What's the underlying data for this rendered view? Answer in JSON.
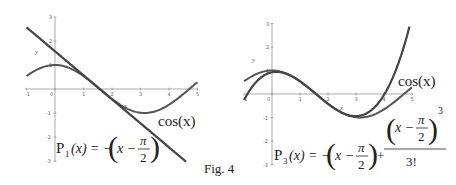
{
  "figure": {
    "caption": "Fig. 4"
  },
  "chart_data": [
    {
      "type": "line",
      "title": "",
      "xlabel": "x",
      "ylabel": "y",
      "xlim": [
        -1,
        5
      ],
      "ylim": [
        -3,
        3
      ],
      "grid": false,
      "x_ticks": [
        "-1",
        "0",
        "1",
        "2",
        "3",
        "4",
        "5"
      ],
      "y_ticks": [
        "3",
        "2",
        "1",
        "-1",
        "-2",
        "-3"
      ],
      "series": [
        {
          "name": "cos(x)",
          "function": "cos(x)",
          "x_range": [
            -1,
            5
          ]
        },
        {
          "name": "P1(x)",
          "function": "-(x - pi/2)",
          "x_range": [
            -1,
            4.6
          ]
        }
      ],
      "annotations": {
        "curve_label": "cos(x)",
        "formula_lhs": "P",
        "formula_sub": "1",
        "formula_arg": "(x) = −",
        "formula_inner": "x −",
        "formula_pi": "π",
        "formula_two": "2"
      }
    },
    {
      "type": "line",
      "title": "",
      "xlabel": "x",
      "ylabel": "y",
      "xlim": [
        -1,
        5
      ],
      "ylim": [
        -3,
        3
      ],
      "grid": false,
      "x_ticks": [
        "-1",
        "0",
        "1",
        "2",
        "3",
        "4",
        "5"
      ],
      "y_ticks": [
        "3",
        "2",
        "1",
        "-1",
        "-2",
        "-3"
      ],
      "series": [
        {
          "name": "cos(x)",
          "function": "cos(x)",
          "x_range": [
            -1,
            5
          ]
        },
        {
          "name": "P3(x)",
          "function": "-(x - pi/2) + (x - pi/2)^3 / 3!",
          "x_range": [
            -1,
            5
          ]
        }
      ],
      "annotations": {
        "curve_label": "cos(x)",
        "formula_lhs": "P",
        "formula_sub": "3",
        "formula_arg": "(x) = −",
        "formula_inner": "x −",
        "formula_pi": "π",
        "formula_two": "2",
        "formula_plus": "+",
        "formula_exp": "3",
        "formula_den": "3!"
      }
    }
  ]
}
